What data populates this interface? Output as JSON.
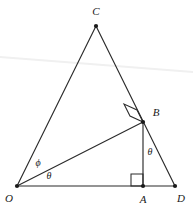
{
  "canvas": {
    "width": 193,
    "height": 208,
    "background": "#ffffff",
    "stroke_color": "#2b2b2b",
    "artifact_color": "#f0f0f0"
  },
  "figure": {
    "type": "geometry-diagram",
    "points": [
      {
        "id": "O",
        "label": "O",
        "x": 17,
        "y": 186,
        "label_x": 9,
        "label_y": 198,
        "dot": true
      },
      {
        "id": "A",
        "label": "A",
        "x": 143,
        "y": 186,
        "label_x": 143,
        "label_y": 199,
        "dot": true
      },
      {
        "id": "D",
        "label": "D",
        "x": 175,
        "y": 186,
        "label_x": 181,
        "label_y": 198,
        "dot": true
      },
      {
        "id": "B",
        "label": "B",
        "x": 143,
        "y": 122,
        "label_x": 156,
        "label_y": 112,
        "dot": true
      },
      {
        "id": "C",
        "label": "C",
        "x": 96,
        "y": 26,
        "label_x": 96,
        "label_y": 11,
        "dot": true
      }
    ],
    "segments": [
      {
        "id": "OC",
        "from": "O",
        "to": "C",
        "x1": 17,
        "y1": 186,
        "x2": 96,
        "y2": 26
      },
      {
        "id": "CD",
        "from": "C",
        "to": "D",
        "x1": 96,
        "y1": 26,
        "x2": 175,
        "y2": 186
      },
      {
        "id": "OD",
        "from": "O",
        "to": "D",
        "x1": 17,
        "y1": 186,
        "x2": 175,
        "y2": 186
      },
      {
        "id": "OB",
        "from": "O",
        "to": "B",
        "x1": 17,
        "y1": 186,
        "x2": 143,
        "y2": 122
      },
      {
        "id": "BA",
        "from": "B",
        "to": "A",
        "x1": 143,
        "y1": 122,
        "x2": 143,
        "y2": 186
      }
    ],
    "right_angles": [
      {
        "id": "right-angle-at-B",
        "at": "B",
        "points": "143,122 130,116 124,104 137,110",
        "note": "OB perpendicular to CD"
      },
      {
        "id": "right-angle-at-A",
        "at": "A",
        "points": "143,186 131,186 131,174 143,174",
        "note": "BA perpendicular to OD"
      }
    ],
    "angle_labels": [
      {
        "id": "angle-phi-at-O",
        "text": "ϕ",
        "x": 38,
        "y": 163,
        "vertex": "O",
        "note": "angle COB"
      },
      {
        "id": "angle-theta-at-O",
        "text": "θ",
        "x": 49,
        "y": 176,
        "vertex": "O",
        "note": "angle BOD"
      },
      {
        "id": "angle-theta-at-B",
        "text": "θ",
        "x": 150,
        "y": 152,
        "vertex": "B",
        "note": "angle ABD"
      }
    ],
    "artifact_line": {
      "id": "scan-artifact-line",
      "x1": 0,
      "y1": 57,
      "x2": 193,
      "y2": 72
    }
  }
}
